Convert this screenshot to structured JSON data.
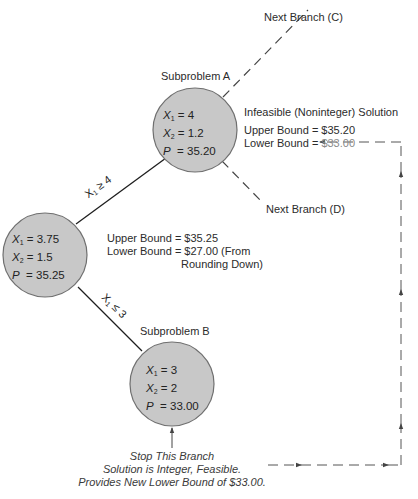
{
  "diagram": {
    "type": "branch-and-bound-tree",
    "root_node": {
      "x1": "3.75",
      "x2": "1.5",
      "p": "35.25",
      "upper_bound_text": "Upper Bound = $35.25",
      "lower_bound_text": "Lower Bound = $27.00 (From",
      "lower_bound_note": "Rounding Down)"
    },
    "subproblem_a": {
      "title": "Subproblem A",
      "x1": "4",
      "x2": "1.2",
      "p": "35.20",
      "status": "Infeasible (Noninteger) Solution",
      "upper_bound_text": "Upper Bound = $35.20",
      "lower_bound_label": "Lower Bound = ",
      "lower_bound_value": "$33.00"
    },
    "subproblem_b": {
      "title": "Subproblem B",
      "x1": "3",
      "x2": "2",
      "p": "33.00"
    },
    "branches": {
      "to_a": {
        "var": "X",
        "sub": "1",
        "rel": "≥ 4"
      },
      "to_b": {
        "var": "X",
        "sub": "1",
        "rel": "≤ 3"
      },
      "next_c": "Next Branch (C)",
      "next_d": "Next Branch (D)"
    },
    "node_labels": {
      "x1": "X",
      "x1_sub": "1",
      "x2": "X",
      "x2_sub": "2",
      "p": "P",
      "eq": "= "
    },
    "stop_note": {
      "line1": "Stop This Branch",
      "line2": "Solution is Integer, Feasible.",
      "line3": "Provides New Lower Bound of $33.00."
    },
    "colors": {
      "node_fill": "#c8c8c8",
      "node_stroke": "#6f6f6f",
      "line": "#1e1e1e",
      "dashed": "#555555",
      "grey_value": "#8a8a8a"
    }
  }
}
